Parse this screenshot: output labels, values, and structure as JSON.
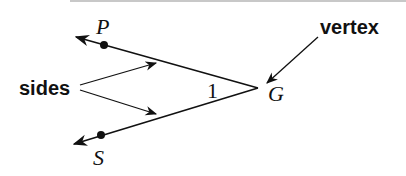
{
  "diagram": {
    "labels": {
      "point_p": "P",
      "point_s": "S",
      "vertex_point": "G",
      "angle_number": "1",
      "sides_label": "sides",
      "vertex_label": "vertex"
    },
    "colors": {
      "stroke": "#111111",
      "background": "#ffffff",
      "top_rule": "#c8c8c8"
    },
    "geometry": {
      "vertex": [
        258,
        88
      ],
      "ray_gp_end": [
        74,
        36
      ],
      "ray_gs_end": [
        72,
        145
      ],
      "point_p": [
        104,
        45
      ],
      "point_s": [
        101,
        135
      ]
    }
  }
}
